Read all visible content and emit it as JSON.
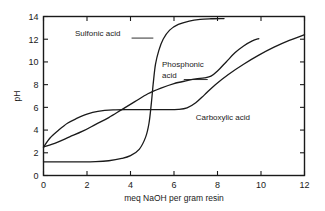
{
  "chart_data": {
    "type": "line",
    "title": "",
    "xlabel": "meq NaOH per gram resin",
    "ylabel": "pH",
    "xlim": [
      0,
      12
    ],
    "ylim": [
      0,
      14
    ],
    "xticks": [
      0,
      2,
      4,
      6,
      8,
      10,
      12
    ],
    "yticks": [
      0,
      2,
      4,
      6,
      8,
      10,
      12,
      14
    ],
    "xtick_labels": [
      "0",
      "2",
      "4",
      "6",
      "8",
      "10",
      "12"
    ],
    "ytick_labels": [
      "0",
      "2",
      "4",
      "6",
      "8",
      "10",
      "12",
      "14"
    ],
    "grid": false,
    "legend": "inline-annotations",
    "series": [
      {
        "name": "Sulfonic acid",
        "label": "Sulfonic acid",
        "x": [
          0.0,
          0.8,
          1.6,
          2.4,
          3.0,
          3.6,
          4.0,
          4.4,
          4.7,
          4.85,
          4.95,
          5.05,
          5.15,
          5.3,
          5.5,
          5.8,
          6.2,
          6.7,
          7.2,
          7.7,
          8.3
        ],
        "y": [
          1.2,
          1.2,
          1.2,
          1.22,
          1.3,
          1.5,
          1.75,
          2.3,
          3.4,
          4.6,
          6.2,
          8.2,
          9.8,
          11.0,
          12.0,
          12.8,
          13.3,
          13.6,
          13.75,
          13.8,
          13.82
        ]
      },
      {
        "name": "Phosphonic acid",
        "label": "Phosphonic acid",
        "x": [
          0.0,
          0.6,
          1.2,
          1.8,
          2.4,
          3.0,
          3.6,
          4.2,
          4.8,
          5.4,
          6.0,
          6.6,
          7.0,
          7.4,
          7.7,
          8.0,
          8.4,
          8.8,
          9.2,
          9.6,
          9.9
        ],
        "y": [
          2.5,
          2.9,
          3.4,
          3.9,
          4.5,
          5.1,
          5.8,
          6.5,
          7.2,
          7.7,
          8.1,
          8.35,
          8.5,
          8.6,
          8.75,
          9.2,
          10.0,
          10.8,
          11.4,
          11.85,
          12.05
        ]
      },
      {
        "name": "Carboxylic acid",
        "label": "Carboxylic acid",
        "x": [
          0.0,
          0.3,
          0.7,
          1.1,
          1.5,
          2.0,
          2.5,
          3.2,
          4.0,
          4.8,
          5.6,
          6.2,
          6.6,
          7.0,
          7.4,
          7.9,
          8.5,
          9.2,
          9.9,
          10.6,
          11.3,
          12.0
        ],
        "y": [
          2.5,
          3.3,
          4.0,
          4.6,
          5.0,
          5.4,
          5.65,
          5.78,
          5.8,
          5.8,
          5.8,
          5.82,
          5.95,
          6.4,
          7.1,
          8.0,
          8.9,
          9.8,
          10.6,
          11.3,
          11.9,
          12.4
        ]
      }
    ],
    "annotations": [
      {
        "name": "sulfonic-acid-annotation",
        "text": "Sulfonic acid",
        "text_x": 1.45,
        "text_y": 12.25,
        "leader_from": [
          4.05,
          12.1
        ],
        "leader_to": [
          5.05,
          12.1
        ]
      },
      {
        "name": "phosphonic-acid-annotation",
        "text_line1": "Phosphonic",
        "text_line2": "acid",
        "text_x": 5.45,
        "text_y": 9.55,
        "leader_from": [
          6.45,
          8.45
        ],
        "leader_to": [
          7.55,
          8.45
        ]
      },
      {
        "name": "carboxylic-acid-annotation",
        "text": "Carboxylic acid",
        "text_x": 7.0,
        "text_y": 4.85
      }
    ]
  }
}
